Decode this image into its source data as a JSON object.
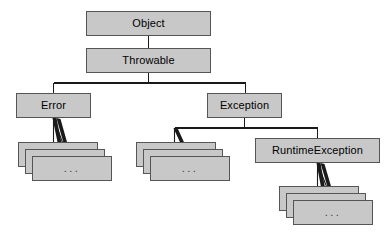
{
  "diagram": {
    "type": "class-hierarchy-tree",
    "background_color": "#ffffff",
    "node_fill_color": "#c8c8c8",
    "node_border_color": "#555555",
    "edge_color": "#1a1a1a",
    "ellipsis_label": "...",
    "nodes": [
      {
        "id": "object",
        "label": "Object",
        "x": 86,
        "y": 11,
        "w": 125,
        "h": 25
      },
      {
        "id": "throwable",
        "label": "Throwable",
        "x": 86,
        "y": 48,
        "w": 125,
        "h": 25
      },
      {
        "id": "error",
        "label": "Error",
        "x": 16,
        "y": 93,
        "w": 75,
        "h": 25
      },
      {
        "id": "exception",
        "label": "Exception",
        "x": 207,
        "y": 93,
        "w": 75,
        "h": 25
      },
      {
        "id": "runtimeexception",
        "label": "RuntimeException",
        "x": 255,
        "y": 138,
        "w": 125,
        "h": 25
      }
    ],
    "stacks": [
      {
        "id": "error-subclasses",
        "parent": "error",
        "label": "...",
        "x": 18,
        "y": 142,
        "w": 80,
        "h": 25,
        "offset_x": 7,
        "offset_y": 7,
        "count": 3
      },
      {
        "id": "exception-subclasses",
        "parent": "exception",
        "label": "...",
        "x": 136,
        "y": 142,
        "w": 80,
        "h": 25,
        "offset_x": 7,
        "offset_y": 7,
        "count": 3
      },
      {
        "id": "runtimeexception-subclasses",
        "parent": "runtimeexception",
        "label": "...",
        "x": 279,
        "y": 186,
        "w": 80,
        "h": 25,
        "offset_x": 7,
        "offset_y": 7,
        "count": 3
      }
    ],
    "edges": [
      {
        "from": "object",
        "to": "throwable",
        "kind": "vertical"
      },
      {
        "from": "throwable",
        "to": "error",
        "kind": "bus"
      },
      {
        "from": "throwable",
        "to": "exception",
        "kind": "bus"
      },
      {
        "from": "exception",
        "to": "exception-subclasses",
        "kind": "bus"
      },
      {
        "from": "exception",
        "to": "runtimeexception",
        "kind": "bus"
      },
      {
        "from": "error",
        "to": "error-subclasses",
        "kind": "fan"
      },
      {
        "from": "runtimeexception",
        "to": "runtimeexception-subclasses",
        "kind": "fan"
      }
    ]
  }
}
